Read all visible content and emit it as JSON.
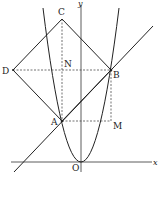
{
  "diagram": {
    "type": "coordinate-geometry",
    "points": {
      "C": {
        "label": "C"
      },
      "D": {
        "label": "D"
      },
      "N": {
        "label": "N"
      },
      "B": {
        "label": "B"
      },
      "A": {
        "label": "A"
      },
      "M": {
        "label": "M"
      },
      "O": {
        "label": "O"
      }
    },
    "axes": {
      "x_label": "x",
      "y_label": "y"
    },
    "colors": {
      "stroke": "#222222",
      "background": "#ffffff"
    }
  }
}
